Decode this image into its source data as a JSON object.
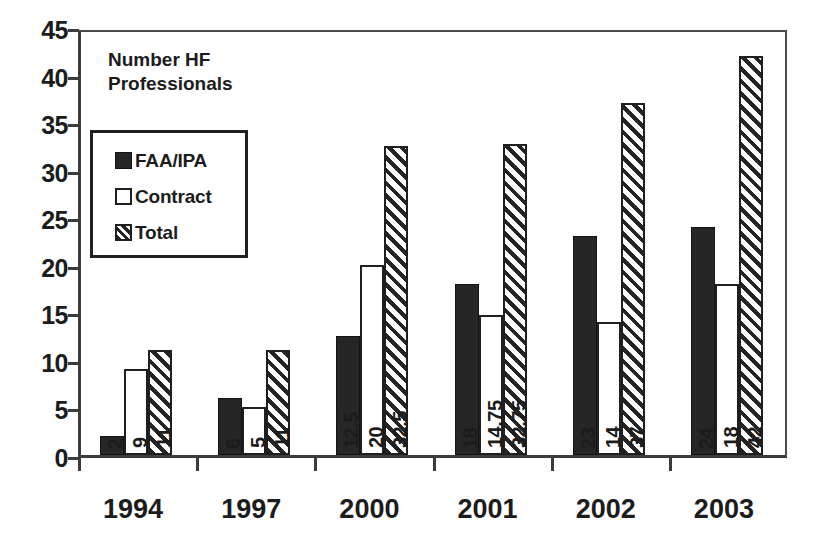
{
  "chart_data": {
    "type": "bar",
    "title": "",
    "annotation": "Number HF\nProfessionals",
    "xlabel": "",
    "ylabel": "",
    "ylim": [
      0,
      45
    ],
    "ytick_step": 5,
    "yticks": [
      0,
      5,
      10,
      15,
      20,
      25,
      30,
      35,
      40,
      45
    ],
    "ytick_labels": [
      "0",
      "5",
      "10",
      "15",
      "20",
      "25",
      "30",
      "35",
      "40",
      "45"
    ],
    "grid": false,
    "legend_position": "upper-left-inside",
    "categories": [
      "1994",
      "1997",
      "2000",
      "2001",
      "2002",
      "2003"
    ],
    "series": [
      {
        "name": "FAA/IPA",
        "style": "solid-black",
        "color": "#262626",
        "values": [
          2,
          6,
          12.5,
          18,
          23,
          24
        ],
        "labels": [
          "2",
          "6",
          "12.5",
          "18",
          "23",
          "24"
        ]
      },
      {
        "name": "Contract",
        "style": "white-outline",
        "color": "#ffffff",
        "values": [
          9,
          5,
          20,
          14.75,
          14,
          18
        ],
        "labels": [
          "9",
          "5",
          "20",
          "14.75",
          "14",
          "18"
        ]
      },
      {
        "name": "Total",
        "style": "diagonal-hatch",
        "color": "#242424",
        "values": [
          11,
          11,
          32.5,
          32.75,
          37,
          42
        ],
        "labels": [
          "11",
          "11",
          "32.5",
          "32.75",
          "37",
          "42"
        ]
      }
    ]
  },
  "legend": {
    "entries": [
      {
        "label": "FAA/IPA"
      },
      {
        "label": "Contract"
      },
      {
        "label": "Total"
      }
    ]
  },
  "colors": {
    "axis": "#3b3b3b",
    "text": "#1c1c1c",
    "series_faa": "#262626",
    "series_contract": "#ffffff",
    "series_total": "#242424",
    "background": "#ffffff"
  }
}
